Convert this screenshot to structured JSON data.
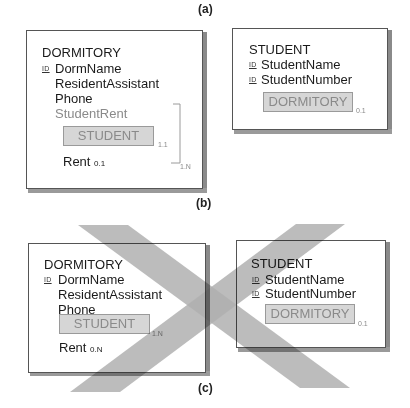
{
  "panels": {
    "a": {
      "label": "(a)",
      "dormitory": {
        "title": "DORMITORY",
        "id_tag": "ID",
        "attributes": [
          "DormName",
          "ResidentAssistant",
          "Phone"
        ],
        "group_attribute": "StudentRent",
        "object_ref": "STUDENT",
        "object_ref_cardinality": "1.1",
        "rent_label": "Rent",
        "rent_cardinality": "0.1",
        "group_cardinality": "1.N"
      },
      "student": {
        "title": "STUDENT",
        "id_tag": "ID",
        "attributes": [
          "StudentName",
          "StudentNumber"
        ],
        "object_ref": "DORMITORY",
        "object_ref_cardinality": "0.1"
      }
    },
    "b": {
      "label": "(b)"
    },
    "c": {
      "label": "(c)",
      "crossed_out": true,
      "dormitory": {
        "title": "DORMITORY",
        "id_tag": "ID",
        "attributes": [
          "DormName",
          "ResidentAssistant",
          "Phone"
        ],
        "object_ref": "STUDENT",
        "object_ref_cardinality": "1.N",
        "rent_label": "Rent",
        "rent_cardinality": "0.N"
      },
      "student": {
        "title": "STUDENT",
        "id_tag": "ID",
        "attributes": [
          "StudentName",
          "StudentNumber"
        ],
        "object_ref": "DORMITORY",
        "object_ref_cardinality": "0.1"
      }
    }
  },
  "colors": {
    "cross_band": "#b0b0b0",
    "object_ref_fill": "#d6d6d6",
    "muted_text": "#8a8a8a"
  }
}
